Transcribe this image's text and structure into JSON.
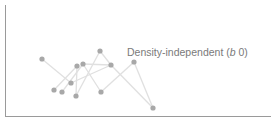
{
  "chart_data": {
    "type": "scatter",
    "title": "",
    "xlabel": "",
    "ylabel": "",
    "grid": false,
    "legend": null,
    "annotation": {
      "text_prefix": "Density-independent (",
      "text_italic": "b",
      "text_suffix": " 0)",
      "full_text": "Density-independent (b 0)",
      "x": 127,
      "y": 56
    },
    "axes": {
      "y_axis": {
        "x": 5,
        "y_top": 5,
        "y_bottom": 116
      },
      "x_axis": {
        "y": 116,
        "x_left": 5,
        "x_right": 271
      }
    },
    "points": [
      {
        "id": 0,
        "x": 42,
        "y": 59
      },
      {
        "id": 1,
        "x": 54,
        "y": 90
      },
      {
        "id": 2,
        "x": 62,
        "y": 92
      },
      {
        "id": 3,
        "x": 71,
        "y": 83
      },
      {
        "id": 4,
        "x": 77,
        "y": 66
      },
      {
        "id": 5,
        "x": 83,
        "y": 64
      },
      {
        "id": 6,
        "x": 76,
        "y": 96
      },
      {
        "id": 7,
        "x": 100,
        "y": 51
      },
      {
        "id": 8,
        "x": 111,
        "y": 65
      },
      {
        "id": 9,
        "x": 101,
        "y": 92
      },
      {
        "id": 10,
        "x": 134,
        "y": 62
      },
      {
        "id": 11,
        "x": 153,
        "y": 108
      }
    ],
    "links": [
      [
        0,
        3
      ],
      [
        3,
        8
      ],
      [
        4,
        6
      ],
      [
        6,
        7
      ],
      [
        7,
        8
      ],
      [
        8,
        11
      ],
      [
        5,
        8
      ],
      [
        5,
        9
      ],
      [
        9,
        10
      ],
      [
        10,
        11
      ],
      [
        1,
        4
      ],
      [
        2,
        5
      ]
    ],
    "colors": {
      "points": "#a8a8a8",
      "links": "#e0e0e0",
      "axes": "#9a9a9a",
      "label": "#7a7a7a"
    }
  }
}
